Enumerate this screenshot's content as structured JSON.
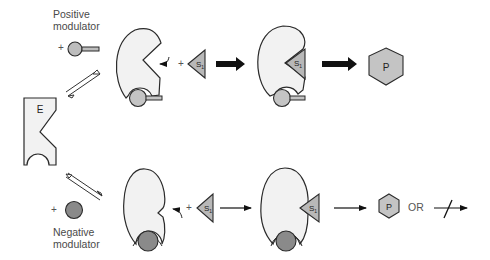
{
  "diagram": {
    "enzyme_label": "E",
    "substrate_label": "S",
    "substrate_subscript": "1",
    "product_label": "P",
    "positive_modulator": {
      "line1": "Positive",
      "line2": "modulator"
    },
    "negative_modulator": {
      "line1": "Negative",
      "line2": "modulator"
    },
    "plus": "+",
    "or_label": "OR",
    "colors": {
      "enzyme_fill": "#f2f2f2",
      "outline": "#2a2a2a",
      "positive_modulator_fill": "#bdbdbd",
      "negative_modulator_fill": "#8a8a8a",
      "substrate_fill": "#b8b8b8",
      "product_fill": "#c4c4c4",
      "arrow": "#111111"
    },
    "pathways": [
      {
        "name": "positive",
        "steps": [
          "E + positive modulator",
          "active E",
          "+ S1",
          "E-S1 complex",
          "P"
        ],
        "arrow_weight": "thick"
      },
      {
        "name": "negative",
        "steps": [
          "E + negative modulator",
          "inactive E",
          "+ S1",
          "E-S1 complex",
          "P OR no reaction"
        ],
        "arrow_weight": "thin"
      }
    ]
  }
}
